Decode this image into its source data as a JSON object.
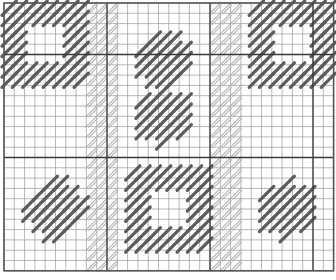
{
  "diagram": {
    "type": "needlepoint-stitch-chart",
    "width": 336,
    "height": 280,
    "grid": {
      "origin_x": 4,
      "origin_y": 3,
      "cell": 10.3,
      "cols": 32,
      "rows": 26,
      "minor_color": "#9a9a9a",
      "major_color": "#3a3a3a"
    },
    "major_lines": {
      "vertical_cols": [
        10,
        20,
        30
      ],
      "horizontal_rows": [
        5,
        15
      ]
    },
    "colors": {
      "dark_stitch": "#5c5c5c",
      "light_stitch": "#b4b4b4",
      "background": "#ffffff"
    },
    "light_hatch_columns": [
      {
        "name": "left-hatch-band",
        "col_start": 8,
        "col_end": 11,
        "row_start": 0,
        "row_end": 26
      },
      {
        "name": "right-hatch-band",
        "col_start": 20,
        "col_end": 23,
        "row_start": 0,
        "row_end": 26
      }
    ],
    "motifs": [
      {
        "name": "square-ring-top-left",
        "shape": "ring",
        "col": 0,
        "row": 0,
        "size": 8,
        "thickness": 2
      },
      {
        "name": "dot-top-center",
        "shape": "dot",
        "cx": 15.5,
        "cy": 5.5,
        "r": 2.8
      },
      {
        "name": "dot-middle-center",
        "shape": "dot",
        "cx": 15.5,
        "cy": 11,
        "r": 2.6
      },
      {
        "name": "square-ring-top-right",
        "shape": "ring",
        "col": 24,
        "row": 0,
        "size": 8,
        "thickness": 2
      },
      {
        "name": "square-ring-bottom-center",
        "shape": "ring",
        "col": 12,
        "row": 16,
        "size": 8,
        "thickness": 2
      },
      {
        "name": "dot-bottom-left",
        "shape": "dot",
        "cx": 5,
        "cy": 20,
        "r": 2.6
      },
      {
        "name": "dot-bottom-right",
        "shape": "dot",
        "cx": 27.5,
        "cy": 20,
        "r": 2.6
      }
    ]
  }
}
